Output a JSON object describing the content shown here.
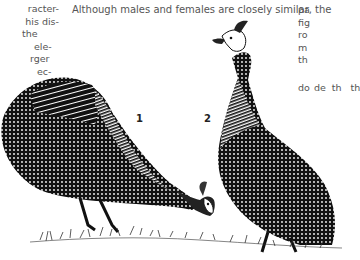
{
  "text": {
    "left_column": [
      "racter-",
      "his dis-",
      "the",
      "ele-",
      "rger",
      "ec-"
    ],
    "headline": "Although males and females are closely similar, the",
    "right_column_top": [
      "pa",
      "fig",
      "ro",
      "m",
      "th"
    ],
    "right_column_bottom": [
      "do",
      "de",
      "th",
      "th"
    ]
  },
  "figure": {
    "labels": [
      "1",
      "2"
    ]
  }
}
